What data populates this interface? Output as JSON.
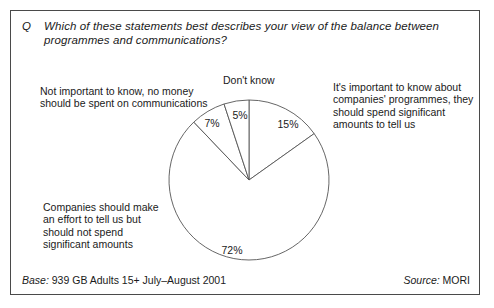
{
  "question": {
    "marker": "Q",
    "text": "Which of these statements best describes your view of the balance between programmes and communications?"
  },
  "labels": {
    "not_important": "Not important to know, no money should be spent on communications",
    "dont_know": "Don't know",
    "its_important": "It's important to know about companies' programmes, they should spend significant amounts to tell us",
    "companies_should": "Companies should make an effort to tell us but should not spend significant amounts"
  },
  "footer": {
    "base_key": "Base:",
    "base_value": "939 GB Adults 15+ July–August 2001",
    "source_key": "Source:",
    "source_value": "MORI"
  },
  "chart_data": {
    "type": "pie",
    "title": "Which of these statements best describes your view of the balance between programmes and communications?",
    "unit": "%",
    "start_angle_deg": 0,
    "direction": "clockwise",
    "base": "939 GB Adults 15+ July–August 2001",
    "source": "MORI",
    "categories": [
      "It's important to know about companies' programmes, they should spend significant amounts to tell us",
      "Companies should make an effort to tell us but should not spend significant amounts",
      "Not important to know, no money should be spent on communications",
      "Don't know"
    ],
    "values": [
      15,
      72,
      7,
      5
    ],
    "slices": [
      {
        "label": "It's important to know about companies' programmes, they should spend significant amounts to tell us",
        "value": 15,
        "display": "15%",
        "fill": "#ffffff",
        "stroke": "#555555"
      },
      {
        "label": "Companies should make an effort to tell us but should not spend significant amounts",
        "value": 72,
        "display": "72%",
        "fill": "#ffffff",
        "stroke": "#555555"
      },
      {
        "label": "Not important to know, no money should be spent on communications",
        "value": 7,
        "display": "7%",
        "fill": "#ffffff",
        "stroke": "#555555"
      },
      {
        "label": "Don't know",
        "value": 5,
        "display": "5%",
        "fill": "#ffffff",
        "stroke": "#555555"
      }
    ],
    "value_labels": {
      "v15": "15%",
      "v72": "72%",
      "v7": "7%",
      "v5": "5%"
    },
    "legend": "none",
    "grid": false
  },
  "colors": {
    "frame_border": "#4a4a4a",
    "pie_stroke": "#555555",
    "pie_fill": "#ffffff",
    "text": "#1a1a1a",
    "background": "#ffffff"
  }
}
